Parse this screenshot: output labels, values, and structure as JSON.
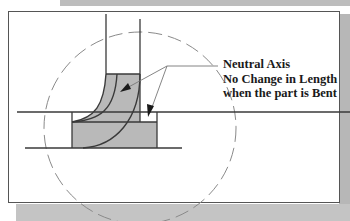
{
  "figure": {
    "type": "sheet-metal-bend-diagram",
    "annotation": {
      "lines": [
        "Neutral Axis",
        "No Change in Length",
        "when the part is Bent"
      ]
    },
    "elements": {
      "dashed_circle": "bend-region-circle",
      "vertical_flange": "vertical-flange",
      "horizontal_flange": "horizontal-flange",
      "bend_zone": "shaded-bend-zone",
      "neutral_axis_arc": "neutral-axis-arc",
      "leader_arrows": 2
    },
    "colors": {
      "shading": "#b9b9b9",
      "outline": "#3a3a3a",
      "dashed_circle": "#8a8a8a",
      "leader": "#777777",
      "text": "#1a1a1a"
    }
  }
}
